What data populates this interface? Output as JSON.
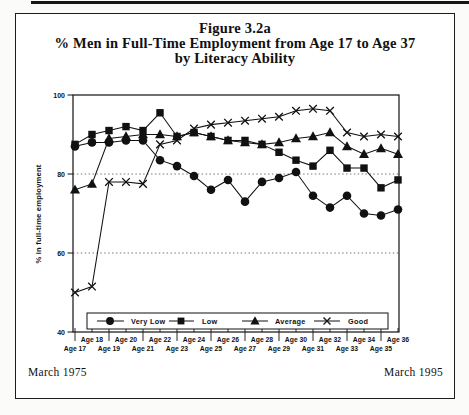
{
  "figure": {
    "number": "Figure 3.2a",
    "title": "% Men in Full-Time Employment from Age 17 to Age 37",
    "subtitle": "by Literacy Ability"
  },
  "footer": {
    "left": "March 1975",
    "right": "March 1995"
  },
  "colors": {
    "ink": "#111111",
    "paper": "#ffffff",
    "grid": "#555555"
  },
  "chart_data": {
    "type": "line",
    "title": "Figure 3.2a  % Men in Full-Time Employment from Age 17 to Age 37 by Literacy Ability",
    "xlabel": "",
    "ylabel": "% in full-time employment",
    "ylim": [
      40,
      100
    ],
    "yticks": [
      100,
      80,
      60,
      40
    ],
    "gridlines_dashed_at": [
      80,
      60
    ],
    "grid": "horizontal-dashed",
    "legend_position": "bottom-inside",
    "categories": [
      "Age 17",
      "Age 18",
      "Age 19",
      "Age 20",
      "Age 21",
      "Age 22",
      "Age 23",
      "Age 24",
      "Age 25",
      "Age 26",
      "Age 27",
      "Age 28",
      "Age 29",
      "Age 30",
      "Age 31",
      "Age 32",
      "Age 33",
      "Age 34",
      "Age 35",
      "Age 36"
    ],
    "series": [
      {
        "name": "Very Low",
        "marker": "circle",
        "values": [
          87,
          88,
          88,
          88.5,
          88.5,
          83.5,
          82,
          79.5,
          76,
          78.5,
          73,
          78,
          79,
          80.5,
          74.5,
          71.5,
          74.5,
          70,
          69.5,
          71
        ]
      },
      {
        "name": "Low",
        "marker": "square",
        "values": [
          87.5,
          90,
          91,
          92,
          91,
          95.5,
          89.5,
          90.5,
          89.5,
          88.5,
          88.5,
          87.5,
          85.5,
          83.5,
          82,
          86,
          81.5,
          81.5,
          76.5,
          78.5
        ]
      },
      {
        "name": "Average",
        "marker": "triangle",
        "values": [
          76,
          77.5,
          89,
          89.5,
          90,
          90,
          89.5,
          90.5,
          89.5,
          88.5,
          88,
          87.5,
          88,
          89,
          89.5,
          90.5,
          87,
          85,
          86.5,
          85
        ]
      },
      {
        "name": "Good",
        "marker": "x",
        "values": [
          50,
          51.5,
          78,
          78,
          77.5,
          87.5,
          88.5,
          91.5,
          92.5,
          93,
          93.5,
          94,
          94.5,
          96,
          96.5,
          96,
          90.5,
          89.5,
          90,
          89.5
        ]
      }
    ]
  }
}
